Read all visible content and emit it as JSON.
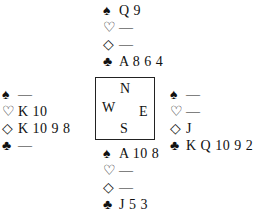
{
  "diagram": {
    "type": "bridge-deal",
    "hands": {
      "north": {
        "spades": "Q 9",
        "hearts": "—",
        "diamonds": "—",
        "clubs": "A 8 6 4"
      },
      "west": {
        "spades": "—",
        "hearts": "K 10",
        "diamonds": "K 10 9 8",
        "clubs": "—"
      },
      "east": {
        "spades": "—",
        "hearts": "—",
        "diamonds": "J",
        "clubs": "K Q 10 9 2"
      },
      "south": {
        "spades": "A 10 8",
        "hearts": "—",
        "diamonds": "—",
        "clubs": "J 5 3"
      }
    },
    "compass": {
      "n": "N",
      "w": "W",
      "e": "E",
      "s": "S"
    },
    "suits": {
      "spades": "♠",
      "hearts": "♡",
      "diamonds": "◇",
      "clubs": "♣"
    }
  }
}
